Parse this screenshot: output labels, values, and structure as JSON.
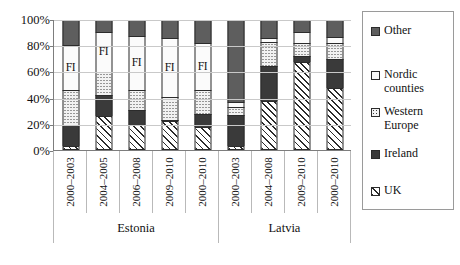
{
  "chart_data": {
    "type": "bar",
    "subtype": "stacked-percent",
    "title": "",
    "xlabel": "",
    "ylabel": "",
    "ylim": [
      0,
      100
    ],
    "ytick_labels": [
      "0%",
      "20%",
      "40%",
      "60%",
      "80%",
      "100%"
    ],
    "ytick_values": [
      0,
      20,
      40,
      60,
      80,
      100
    ],
    "grid": true,
    "legend_position": "right",
    "stack_order_bottom_to_top": [
      "UK",
      "Ireland",
      "Western Europe",
      "Nordic counties",
      "Other"
    ],
    "groups": [
      {
        "name": "Estonia",
        "categories": [
          "2000–2003",
          "2004–2005",
          "2006–2008",
          "2009–2010",
          "2000–2010"
        ]
      },
      {
        "name": "Latvia",
        "categories": [
          "2000–2003",
          "2004–2008",
          "2009–2010",
          "2000–2010"
        ]
      }
    ],
    "categories": [
      "2000–2003",
      "2004–2005",
      "2006–2008",
      "2009–2010",
      "2000–2010",
      "2000–2003",
      "2004–2008",
      "2009–2010",
      "2000–2010"
    ],
    "series": [
      {
        "name": "UK",
        "pattern": "diagonal-hatch",
        "color": "#ffffff",
        "values": [
          3,
          26,
          19,
          22,
          18,
          3,
          38,
          68,
          48
        ]
      },
      {
        "name": "Ireland",
        "pattern": "solid-dark",
        "color": "#3a3a3a",
        "values": [
          16,
          16,
          12,
          1,
          10,
          24,
          27,
          4,
          22
        ]
      },
      {
        "name": "Western Europe",
        "pattern": "dotted",
        "color": "#f2f2f2",
        "values": [
          27,
          18,
          15,
          18,
          18,
          6,
          18,
          10,
          12
        ]
      },
      {
        "name": "Nordic counties",
        "pattern": "white",
        "color": "#fbfbfb",
        "values": [
          35,
          31,
          42,
          45,
          36,
          4,
          3,
          9,
          5
        ]
      },
      {
        "name": "Other",
        "pattern": "solid-gray",
        "color": "#5e5e5e",
        "values": [
          19,
          9,
          12,
          14,
          18,
          63,
          14,
          9,
          13
        ]
      }
    ],
    "annotations": [
      {
        "text": "FI",
        "category_index": 0,
        "series": "Nordic counties",
        "value_at": 60
      },
      {
        "text": "FI",
        "category_index": 1,
        "series": "Nordic counties",
        "value_at": 79
      },
      {
        "text": "FI",
        "category_index": 2,
        "series": "Nordic counties",
        "value_at": 63
      },
      {
        "text": "FI",
        "category_index": 3,
        "series": "Nordic counties",
        "value_at": 57
      },
      {
        "text": "FI",
        "category_index": 4,
        "series": "Nordic counties",
        "value_at": 57
      }
    ]
  },
  "legend": {
    "items": [
      {
        "label": "Other",
        "swatch": "solid-gray-swatch"
      },
      {
        "label": "Nordic counties",
        "swatch": "white-swatch"
      },
      {
        "label": "Western Europe",
        "swatch": "dotted-swatch"
      },
      {
        "label": "Ireland",
        "swatch": "solid-dark-swatch"
      },
      {
        "label": "UK",
        "swatch": "diagonal-hatch-swatch"
      }
    ]
  }
}
